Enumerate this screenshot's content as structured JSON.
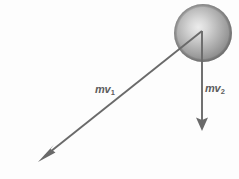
{
  "figure": {
    "kind": "physics-vector-diagram",
    "background_color": "#fdfdfd",
    "width": 239,
    "height": 179
  },
  "sphere": {
    "name": "ball",
    "center_x": 203,
    "center_y": 33,
    "radius": 29,
    "highlight_color": "#e8e8e8",
    "mid_color": "#a8a8a8",
    "edge_color": "#6f6f6f"
  },
  "vectors": [
    {
      "id": "mv1",
      "label_m": "m",
      "label_v": "v",
      "label_sub": "1",
      "label_text": "mv1",
      "color": "#6a6a6a",
      "start_x": 202,
      "start_y": 31,
      "end_x": 39,
      "end_y": 161,
      "direction": "down-left",
      "label_x": 95,
      "label_y": 84
    },
    {
      "id": "mv2",
      "label_m": "m",
      "label_v": "v",
      "label_sub": "2",
      "label_text": "mv2",
      "color": "#6a6a6a",
      "start_x": 202,
      "start_y": 31,
      "end_x": 202,
      "end_y": 130,
      "direction": "down",
      "label_x": 205,
      "label_y": 83
    }
  ]
}
